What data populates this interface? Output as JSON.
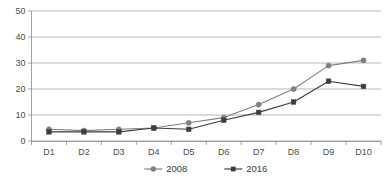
{
  "chart_data": {
    "type": "line",
    "title": "",
    "subtitle": "",
    "xlabel": "",
    "ylabel": "",
    "categories": [
      "D1",
      "D2",
      "D3",
      "D4",
      "D5",
      "D6",
      "D7",
      "D8",
      "D9",
      "D10"
    ],
    "series": [
      {
        "name": "2008",
        "color": "#808080",
        "marker": "circle",
        "values": [
          4.5,
          4,
          4.5,
          5,
          7,
          9,
          14,
          20,
          29,
          31
        ]
      },
      {
        "name": "2016",
        "color": "#3d3d3d",
        "marker": "square",
        "values": [
          3.5,
          3.5,
          3.5,
          5,
          4.5,
          8,
          11,
          15,
          23,
          21
        ]
      }
    ],
    "ylim": [
      0,
      50
    ],
    "yticks": [
      0,
      10,
      20,
      30,
      40,
      50
    ],
    "ytick_labels": [
      "0",
      "10",
      "20",
      "30",
      "40",
      "50"
    ],
    "grid": true,
    "grid_axis": "y",
    "legend_position": "bottom"
  },
  "legend": {
    "entries": [
      {
        "label": "2008",
        "marker": "circle-marker",
        "color": "#808080"
      },
      {
        "label": "2016",
        "marker": "square-marker",
        "color": "#3d3d3d"
      }
    ]
  },
  "axes": {
    "y_tick_labels": [
      "50",
      "40",
      "30",
      "20",
      "10",
      "0"
    ],
    "x_tick_labels": [
      "D1",
      "D2",
      "D3",
      "D4",
      "D5",
      "D6",
      "D7",
      "D8",
      "D9",
      "D10"
    ]
  },
  "colors": {
    "series_2008": "#808080",
    "series_2016": "#3d3d3d",
    "grid": "#9a9a9a",
    "axis": "#8a8a8a",
    "text": "#4d4d4d",
    "background": "#ffffff"
  }
}
